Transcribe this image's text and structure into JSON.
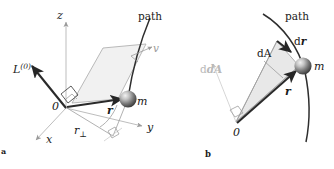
{
  "figure": {
    "caption_panels": [
      {
        "letter": "a",
        "x": 2,
        "y": 151
      },
      {
        "letter": "b",
        "x": 205,
        "y": 155
      }
    ],
    "background_color": "#ffffff",
    "ink_color": "#1a1a1a",
    "accent_gray": "#9a9a9a",
    "plane_fill": "#f1f1f1",
    "sector_fill": "#e8e8e8"
  },
  "panel_a": {
    "name": "angular-momentum-3d",
    "labels": {
      "z_axis": "z",
      "x_axis": "x",
      "y_axis": "y",
      "origin": "0",
      "angular_momentum": "L",
      "angular_momentum_superscript": "(0)",
      "position_vector": "r",
      "perp_distance": "r",
      "perp_distance_subscript": "⊥",
      "mass": "m",
      "velocity": "v",
      "path": "path"
    },
    "label_positions": {
      "z_axis": {
        "x": 57,
        "y": 19
      },
      "x_axis": {
        "x": 46,
        "y": 143
      },
      "y_axis": {
        "x": 147,
        "y": 131
      },
      "origin": {
        "x": 52,
        "y": 110
      },
      "angular_momentum": {
        "x": 13,
        "y": 73
      },
      "position_vector": {
        "x": 107,
        "y": 114
      },
      "perp_distance": {
        "x": 74,
        "y": 134
      },
      "mass": {
        "x": 137,
        "y": 105
      },
      "velocity": {
        "x": 153,
        "y": 52
      },
      "path": {
        "x": 138,
        "y": 20
      }
    }
  },
  "panel_b": {
    "name": "areal-velocity-2d",
    "labels": {
      "path": "path",
      "area_element": "dA",
      "area_vector": "dA",
      "displacement": "d",
      "displacement_vector": "r",
      "position_vector": "r",
      "mass": "m",
      "origin": "0"
    },
    "label_positions": {
      "path": {
        "x": 285,
        "y": 20
      },
      "area_element": {
        "x": 257,
        "y": 57
      },
      "area_vector": {
        "x": 203,
        "y": 73
      },
      "displacement": {
        "x": 297,
        "y": 44
      },
      "position_vector": {
        "x": 287,
        "y": 92
      },
      "mass": {
        "x": 315,
        "y": 68
      },
      "origin": {
        "x": 236,
        "y": 128
      }
    }
  }
}
